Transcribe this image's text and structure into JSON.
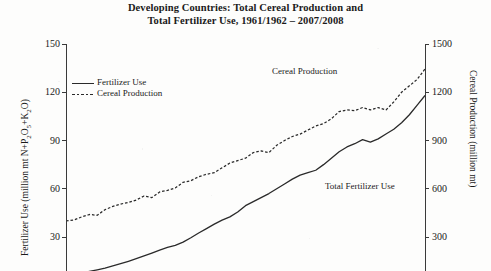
{
  "chart_data": {
    "type": "line",
    "title": "Developing Countries: Total Cereal Production and Total Fertilizer Use, 1961/1962 – 2007/2008",
    "title_line1": "Developing Countries: Total Cereal Production and",
    "title_line2": "Total Fertilizer Use, 1961/1962 – 2007/2008",
    "xlabel": "",
    "grid": false,
    "legend_position": "upper-left",
    "left_axis": {
      "label": "Fertilizer Use (million mt N+P",
      "label_sub1": "2",
      "label_mid": "O",
      "label_sub2": "5",
      "label_mid2": "+K",
      "label_sub3": "2",
      "label_end": "O)",
      "label_full": "Fertilizer Use (million mt N+P2O5+K2O)",
      "ticks": [
        150,
        120,
        90,
        60,
        30
      ],
      "ylim": [
        0,
        150
      ]
    },
    "right_axis": {
      "label": "Cereal Production (million mt)",
      "ticks": [
        1500,
        1200,
        900,
        600,
        300
      ],
      "ylim": [
        0,
        1500
      ]
    },
    "annotations": [
      {
        "text": "Cereal Production",
        "x": 272,
        "y": 66
      },
      {
        "text": "Total Fertilizer Use",
        "x": 325,
        "y": 181
      }
    ],
    "series": [
      {
        "name": "Fertilizer Use",
        "style": "solid",
        "units": "million mt N+P2O5+K2O",
        "x": [
          1961,
          1962,
          1963,
          1964,
          1965,
          1966,
          1967,
          1968,
          1969,
          1970,
          1971,
          1972,
          1973,
          1974,
          1975,
          1976,
          1977,
          1978,
          1979,
          1980,
          1981,
          1982,
          1983,
          1984,
          1985,
          1986,
          1987,
          1988,
          1989,
          1990,
          1991,
          1992,
          1993,
          1994,
          1995,
          1996,
          1997,
          1998,
          1999,
          2000,
          2001,
          2002,
          2003,
          2004,
          2005,
          2006,
          2007
        ],
        "values": [
          6,
          6.8,
          7.6,
          8.6,
          9.6,
          10.7,
          12,
          13.4,
          14.9,
          16.5,
          18.2,
          20,
          21.9,
          23.5,
          24.8,
          26.8,
          29.5,
          32.5,
          35.2,
          38,
          40.5,
          42.5,
          45.5,
          49.5,
          52,
          54.5,
          57,
          60,
          63,
          66,
          68.5,
          70,
          71.5,
          75,
          79,
          83,
          86,
          88,
          90.5,
          89,
          91,
          94,
          97,
          101,
          106,
          112,
          118
        ]
      },
      {
        "name": "Cereal Production",
        "style": "dashed",
        "units": "million mt",
        "x": [
          1961,
          1962,
          1963,
          1964,
          1965,
          1966,
          1967,
          1968,
          1969,
          1970,
          1971,
          1972,
          1973,
          1974,
          1975,
          1976,
          1977,
          1978,
          1979,
          1980,
          1981,
          1982,
          1983,
          1984,
          1985,
          1986,
          1987,
          1988,
          1989,
          1990,
          1991,
          1992,
          1993,
          1994,
          1995,
          1996,
          1997,
          1998,
          1999,
          2000,
          2001,
          2002,
          2003,
          2004,
          2005,
          2006,
          2007
        ],
        "values": [
          400,
          405,
          425,
          440,
          435,
          470,
          490,
          505,
          515,
          530,
          555,
          545,
          580,
          590,
          605,
          640,
          650,
          675,
          690,
          700,
          730,
          760,
          775,
          790,
          825,
          835,
          825,
          870,
          900,
          925,
          940,
          965,
          990,
          1005,
          1035,
          1080,
          1090,
          1085,
          1105,
          1090,
          1105,
          1090,
          1140,
          1200,
          1240,
          1280,
          1345
        ]
      }
    ]
  },
  "legend": {
    "items": [
      {
        "label": "Fertilizer Use",
        "style": "solid"
      },
      {
        "label": "Cereal Production",
        "style": "dashed"
      }
    ]
  }
}
